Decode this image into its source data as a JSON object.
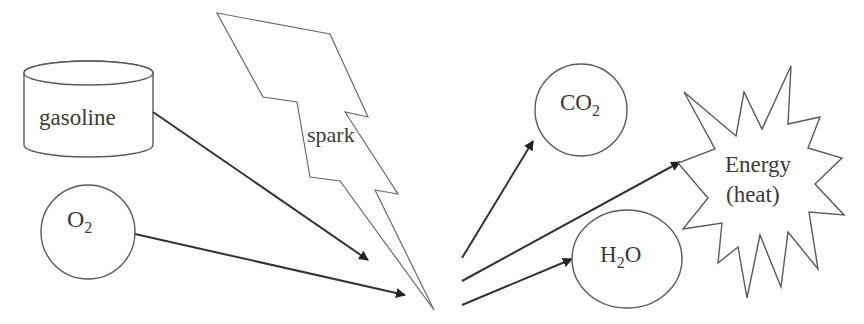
{
  "diagram": {
    "type": "combustion-reaction",
    "reactants": [
      {
        "id": "gasoline",
        "label": "gasoline",
        "shape": "cylinder"
      },
      {
        "id": "o2",
        "label": "O",
        "subscript": "2",
        "shape": "circle"
      }
    ],
    "catalyst": {
      "id": "spark",
      "label": "spark",
      "shape": "lightning-bolt"
    },
    "products": [
      {
        "id": "co2",
        "label": "CO",
        "subscript": "2",
        "shape": "circle"
      },
      {
        "id": "h2o",
        "label_pre": "H",
        "subscript": "2",
        "label_post": "O",
        "shape": "ellipse"
      },
      {
        "id": "energy",
        "label_line1": "Energy",
        "label_line2": "(heat)",
        "shape": "starburst"
      }
    ],
    "arrows": [
      {
        "from": "gasoline",
        "to": "reaction-point"
      },
      {
        "from": "o2",
        "to": "reaction-point"
      },
      {
        "from": "reaction-point",
        "to": "co2"
      },
      {
        "from": "reaction-point",
        "to": "energy"
      },
      {
        "from": "reaction-point",
        "to": "h2o"
      }
    ],
    "colors": {
      "stroke": "#5a5a5a",
      "arrow": "#333333",
      "text": "#3a3a3a",
      "background": "#ffffff"
    }
  }
}
